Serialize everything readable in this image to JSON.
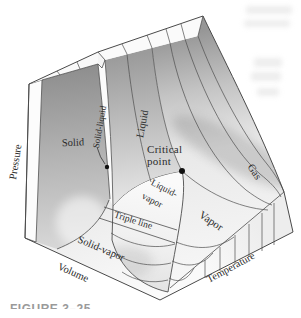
{
  "diagram": {
    "axes": {
      "pressure": "Pressure",
      "volume": "Volume",
      "temperature": "Temperature"
    },
    "regions": {
      "solid": "Solid",
      "solid_liquid": "Solid-liquid",
      "liquid": "Liquid",
      "gas": "Gas",
      "vapor": "Vapor",
      "liquid_vapor_line1": "Liquid-",
      "liquid_vapor_line2": "vapor",
      "triple_line": "Triple line",
      "solid_vapor": "Solid-vapor"
    },
    "annotations": {
      "critical_point_line1": "Critical",
      "critical_point_line2": "point"
    },
    "caption": "FIGURE 3–25"
  },
  "colors": {
    "line": "#4d4d4d",
    "text": "#2b2b2b",
    "solid_face_dark": "#8f8f8f",
    "face_light": "#f4f4f4",
    "marker": "#111111",
    "background": "#ffffff"
  }
}
